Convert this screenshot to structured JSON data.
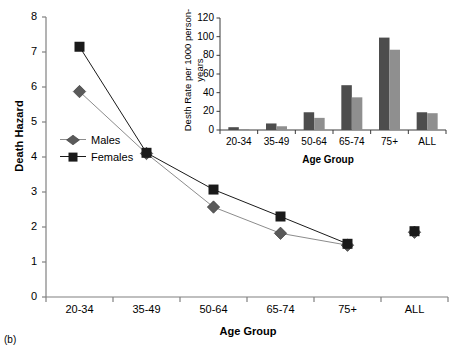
{
  "panel": {
    "label": "(b)"
  },
  "chart_data": [
    {
      "id": "main",
      "type": "line",
      "title": "",
      "xlabel": "Age Group",
      "ylabel": "Death Hazard",
      "categories": [
        "20-34",
        "35-49",
        "50-64",
        "65-74",
        "75+",
        "ALL"
      ],
      "ylim": [
        0,
        8
      ],
      "yticks": [
        0,
        1,
        2,
        3,
        4,
        5,
        6,
        7,
        8
      ],
      "grid": false,
      "legend_position": "inside-left",
      "series": [
        {
          "name": "Males",
          "marker": "diamond",
          "color": "#5a5a5a",
          "line_color": "#8c8c8c",
          "values": [
            5.87,
            4.1,
            2.57,
            1.82,
            1.48,
            1.85
          ]
        },
        {
          "name": "Females",
          "marker": "square",
          "color": "#1a1a1a",
          "line_color": "#1a1a1a",
          "values": [
            7.15,
            4.12,
            3.07,
            2.3,
            1.52,
            1.88
          ]
        }
      ]
    },
    {
      "id": "inset",
      "type": "bar",
      "title": "",
      "xlabel": "Age Group",
      "ylabel": "Desth Rate per 1000 person-years",
      "categories": [
        "20-34",
        "35-49",
        "50-64",
        "65-74",
        "75+",
        "ALL"
      ],
      "ylim": [
        0,
        120
      ],
      "yticks": [
        0,
        20,
        40,
        60,
        80,
        100,
        120
      ],
      "grid": false,
      "series": [
        {
          "name": "series-dark",
          "color": "#4d4d4d",
          "values": [
            3,
            7,
            19,
            48,
            99,
            19
          ]
        },
        {
          "name": "series-light",
          "color": "#8f8f8f",
          "values": [
            1,
            4,
            13,
            35,
            86,
            18
          ]
        }
      ]
    }
  ]
}
